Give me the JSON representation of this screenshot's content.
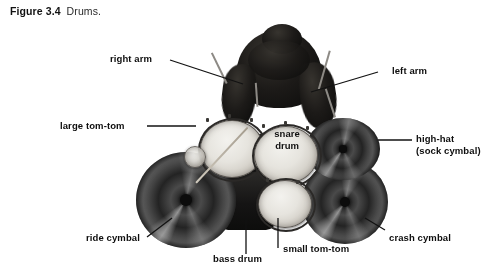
{
  "caption": {
    "figure_number": "Figure 3.4",
    "figure_text": "Drums."
  },
  "photo": {
    "subject": "drum-kit-overhead-with-drummer",
    "style": "black-and-white-photograph"
  },
  "labels": [
    {
      "id": "right-arm",
      "text": "right arm",
      "position": "upper-left"
    },
    {
      "id": "left-arm",
      "text": "left arm",
      "position": "upper-right"
    },
    {
      "id": "large-tom-tom",
      "text": "large tom-tom",
      "position": "middle-left"
    },
    {
      "id": "high-hat",
      "line1": "high-hat",
      "line2": "(sock cymbal)",
      "position": "middle-right"
    },
    {
      "id": "snare-drum",
      "line1": "snare",
      "line2": "drum",
      "position": "center-on-image"
    },
    {
      "id": "ride-cymbal",
      "text": "ride cymbal",
      "position": "lower-left"
    },
    {
      "id": "bass-drum",
      "text": "bass drum",
      "position": "bottom-center-left"
    },
    {
      "id": "small-tom-tom",
      "text": "small tom-tom",
      "position": "bottom-center-right"
    },
    {
      "id": "crash-cymbal",
      "text": "crash cymbal",
      "position": "lower-right"
    }
  ],
  "colors": {
    "background": "#ffffff",
    "text": "#0d0d0d",
    "leader_line": "#121212",
    "cymbal_dark": "#2a2a2a",
    "drumhead_light": "#e6e4de",
    "shell_dark": "#151414"
  }
}
